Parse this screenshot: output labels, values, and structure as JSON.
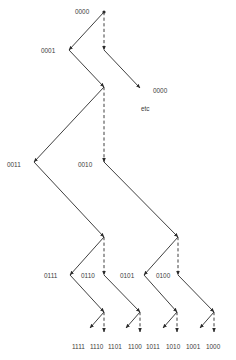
{
  "diagram": {
    "type": "binary-tree",
    "legend_note": "solid arrow = one branch, dashed arrow = other branch",
    "nodes": [
      {
        "id": "n0",
        "label": "0000",
        "x": 104,
        "y": 12,
        "label_x": 75,
        "label_y": 14
      },
      {
        "id": "n1",
        "label": "0001",
        "x": 69,
        "y": 50,
        "label_x": 41,
        "label_y": 53
      },
      {
        "id": "n1b",
        "label": "",
        "x": 104,
        "y": 50
      },
      {
        "id": "n2",
        "label": "",
        "x": 104,
        "y": 87
      },
      {
        "id": "n3",
        "label": "0011",
        "x": 34,
        "y": 162,
        "label_x": 7,
        "label_y": 167
      },
      {
        "id": "n4",
        "label": "0010",
        "x": 104,
        "y": 162,
        "label_x": 78,
        "label_y": 167
      },
      {
        "id": "n5",
        "label": "",
        "x": 104,
        "y": 237
      },
      {
        "id": "n6",
        "label": "",
        "x": 178,
        "y": 237
      },
      {
        "id": "n7",
        "label": "0111",
        "x": 70,
        "y": 275,
        "label_x": 44,
        "label_y": 278
      },
      {
        "id": "n8",
        "label": "0110",
        "x": 104,
        "y": 275,
        "label_x": 81,
        "label_y": 278
      },
      {
        "id": "n9",
        "label": "0101",
        "x": 144,
        "y": 275,
        "label_x": 120,
        "label_y": 278
      },
      {
        "id": "n10",
        "label": "0100",
        "x": 178,
        "y": 275,
        "label_x": 156,
        "label_y": 278
      },
      {
        "id": "n11",
        "label": "",
        "x": 104,
        "y": 312
      },
      {
        "id": "n12",
        "label": "",
        "x": 140,
        "y": 312
      },
      {
        "id": "n13",
        "label": "",
        "x": 177,
        "y": 312
      },
      {
        "id": "n14",
        "label": "",
        "x": 214,
        "y": 312
      }
    ],
    "edges": [
      {
        "from": "n0",
        "to": "n1",
        "style": "solid"
      },
      {
        "from": "n0",
        "to": "n1b",
        "style": "dashed"
      },
      {
        "from": "n1",
        "to": "n2",
        "style": "solid"
      },
      {
        "from": "n1b",
        "to": "etc",
        "style": "solid"
      },
      {
        "from": "n2",
        "to": "n3",
        "style": "solid"
      },
      {
        "from": "n2",
        "to": "n4",
        "style": "dashed"
      },
      {
        "from": "n3",
        "to": "n5",
        "style": "solid"
      },
      {
        "from": "n4",
        "to": "n6",
        "style": "solid"
      },
      {
        "from": "n5",
        "to": "n7",
        "style": "solid"
      },
      {
        "from": "n5",
        "to": "n8",
        "style": "dashed"
      },
      {
        "from": "n6",
        "to": "n9",
        "style": "solid"
      },
      {
        "from": "n6",
        "to": "n10",
        "style": "dashed"
      },
      {
        "from": "n7",
        "to": "n11",
        "style": "solid"
      },
      {
        "from": "n8",
        "to": "n12",
        "style": "solid"
      },
      {
        "from": "n9",
        "to": "n13",
        "style": "solid"
      },
      {
        "from": "n10",
        "to": "n14",
        "style": "solid"
      }
    ],
    "side_branch": {
      "label": "0000",
      "note": "etc",
      "arrow_end": {
        "x": 140,
        "y": 88
      },
      "label_pos": {
        "x": 153,
        "y": 93
      },
      "note_pos": {
        "x": 141,
        "y": 111
      }
    },
    "leaves": [
      {
        "label": "1111",
        "parent": "n11",
        "style": "solid",
        "x": 78
      },
      {
        "label": "1110",
        "parent": "n11",
        "style": "dashed",
        "x": 96
      },
      {
        "label": "1101",
        "parent": "n12",
        "style": "solid",
        "x": 114
      },
      {
        "label": "1100",
        "parent": "n12",
        "style": "dashed",
        "x": 134
      },
      {
        "label": "1011",
        "parent": "n13",
        "style": "solid",
        "x": 152
      },
      {
        "label": "1010",
        "parent": "n13",
        "style": "dashed",
        "x": 172
      },
      {
        "label": "1001",
        "parent": "n14",
        "style": "solid",
        "x": 192
      },
      {
        "label": "1000",
        "parent": "n14",
        "style": "dashed",
        "x": 212
      }
    ],
    "leaf_label_y": 349,
    "colors": {
      "line": "#2a2a2a",
      "text": "#3a3a3a",
      "background": "#ffffff"
    }
  }
}
